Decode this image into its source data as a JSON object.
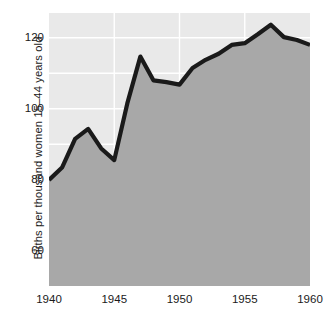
{
  "chart_data": {
    "type": "area",
    "title": "",
    "subtitle": "",
    "xlabel": "",
    "ylabel": "Births per thousand women 15–44 years old",
    "xlim": [
      1940,
      1960
    ],
    "ylim": [
      50,
      127
    ],
    "grid": true,
    "legend": null,
    "x_ticks": [
      "1940",
      "1945",
      "1950",
      "1955",
      "1960"
    ],
    "x_tick_values": [
      1940,
      1945,
      1950,
      1955,
      1960
    ],
    "y_ticks": [
      "60",
      "80",
      "100",
      "120"
    ],
    "y_tick_values": [
      60,
      80,
      100,
      120
    ],
    "y_gridlines": [
      60,
      70,
      80,
      90,
      100,
      110,
      120
    ],
    "x": [
      1940,
      1941,
      1942,
      1943,
      1944,
      1945,
      1946,
      1947,
      1948,
      1949,
      1950,
      1951,
      1952,
      1953,
      1954,
      1955,
      1956,
      1957,
      1958,
      1959,
      1960
    ],
    "values": [
      79.9,
      83.4,
      91.5,
      94.3,
      88.8,
      85.5,
      101.5,
      114.7,
      108.0,
      107.5,
      106.8,
      111.5,
      113.8,
      115.5,
      118.0,
      118.5,
      121.0,
      123.7,
      120.2,
      119.4,
      118.0
    ],
    "series": [
      {
        "name": "Birth rate",
        "values": [
          79.9,
          83.4,
          91.5,
          94.3,
          88.8,
          85.5,
          101.5,
          114.7,
          108.0,
          107.5,
          106.8,
          111.5,
          113.8,
          115.5,
          118.0,
          118.5,
          121.0,
          123.7,
          120.2,
          119.4,
          118.0
        ]
      }
    ],
    "colors": {
      "line": "#1a1a1a",
      "fill_below": "#a8a8a8",
      "plot_background": "#e9e9e9",
      "gridline": "#ffffff",
      "text": "#1a1a1a",
      "page_background": "#ffffff"
    },
    "annotations": []
  }
}
